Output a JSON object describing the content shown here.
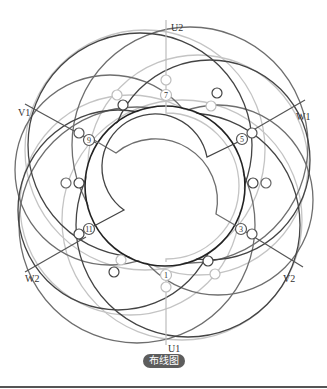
{
  "diagram": {
    "type": "motor-winding-layout",
    "caption": "布线图",
    "terminals": {
      "u1": "U1",
      "u2": "U2",
      "v1": "V1",
      "v2": "V2",
      "w1": "W1",
      "w2": "W2"
    },
    "slot_numbers": [
      "1",
      "3",
      "5",
      "7",
      "9",
      "11"
    ],
    "colors": {
      "dark": "#3a3a3a",
      "mid": "#6a6a6a",
      "light": "#bdbdbd",
      "caption_bg": "#5d5d5d",
      "separator": "#555555"
    }
  }
}
